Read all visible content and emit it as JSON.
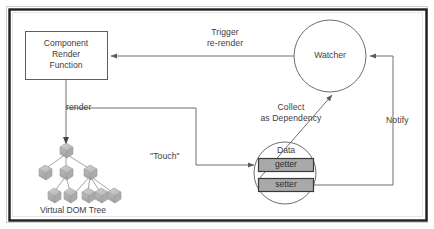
{
  "diagram": {
    "title_present": false,
    "nodes": {
      "component_box": {
        "label": "Component\nRender\nFunction",
        "shape": "rectangle"
      },
      "watcher": {
        "label": "Watcher",
        "shape": "circle"
      },
      "data": {
        "label": "Data",
        "shape": "circle"
      },
      "getter": {
        "label": "getter",
        "shape": "rectangle-filled"
      },
      "setter": {
        "label": "setter",
        "shape": "rectangle-filled"
      },
      "virtual_dom_tree": {
        "label": "Virtual DOM Tree",
        "shape": "tree"
      }
    },
    "edge_labels": {
      "trigger_rerender": "Trigger\nre-render",
      "render": "render",
      "touch": "\"Touch\"",
      "collect_as_dependency": "Collect\nas Dependency",
      "notify": "Notify"
    },
    "colors": {
      "frame": "#222222",
      "line": "#6f6f6f",
      "text": "#3d3d3d",
      "chip_fill": "#a9a9a9",
      "chip_stroke": "#3a3a3a",
      "node_fill": "#b8b8b8",
      "background": "#ffffff"
    }
  }
}
